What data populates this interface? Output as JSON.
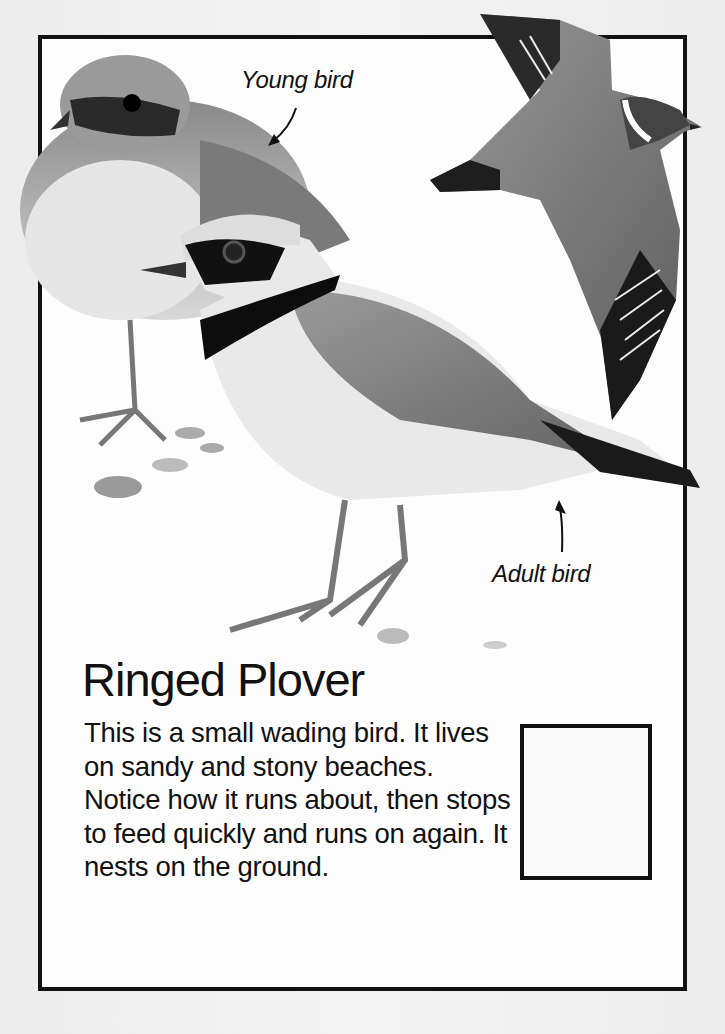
{
  "card": {
    "title": "Ringed Plover",
    "description": "This is a small wading bird. It lives on sandy and stony beaches. Notice how it runs about, then stops to feed quickly and runs on again. It nests on the ground.",
    "labels": {
      "young": "Young bird",
      "adult": "Adult bird"
    },
    "illustrations": [
      {
        "name": "young-bird",
        "description": "Young ringed plover standing"
      },
      {
        "name": "adult-bird",
        "description": "Adult ringed plover standing"
      },
      {
        "name": "flying-bird",
        "description": "Ringed plover in flight"
      },
      {
        "name": "pebbles",
        "description": "Beach pebbles"
      }
    ],
    "tickbox": {
      "checked": false
    },
    "colors": {
      "ink": "#111111",
      "paper": "#fdfdfd",
      "background": "#efefef"
    }
  }
}
